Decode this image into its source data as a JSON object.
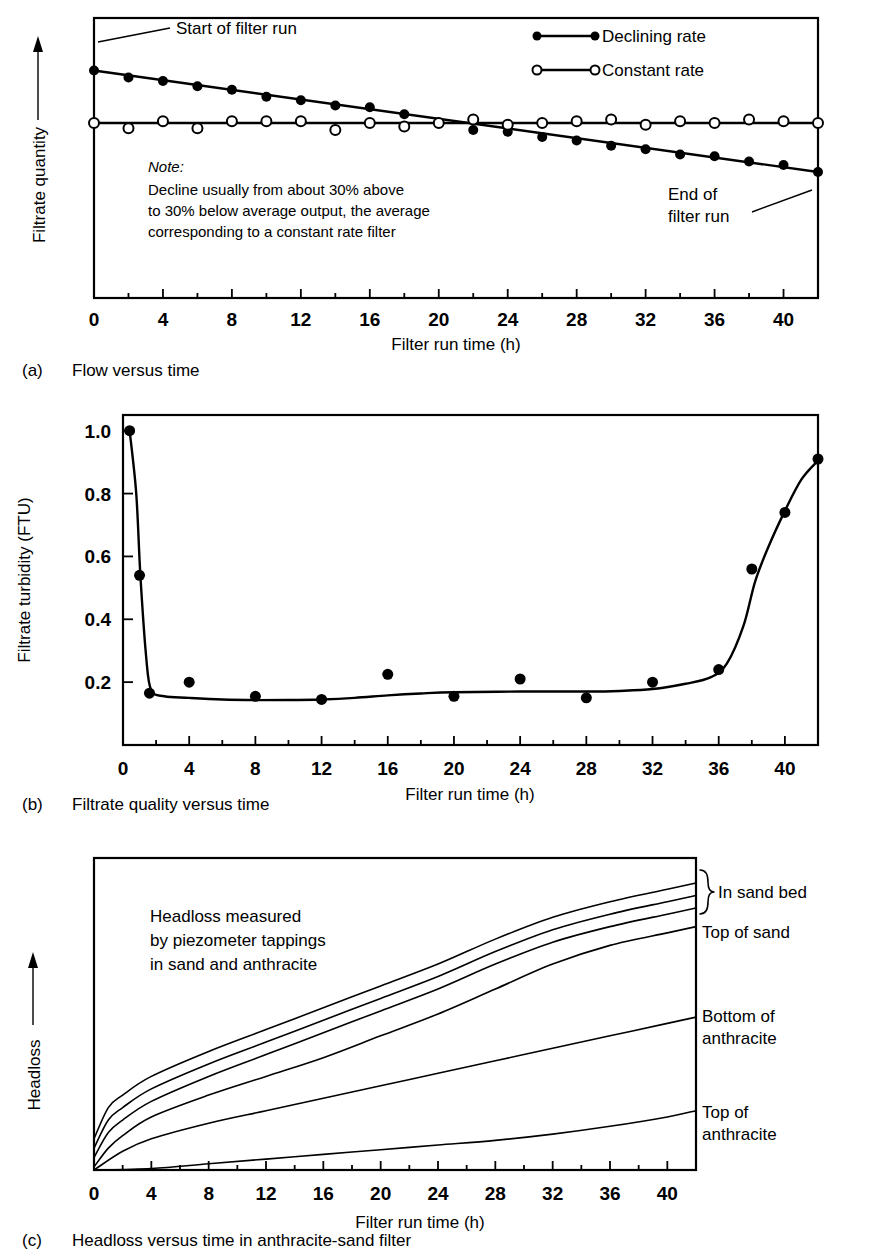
{
  "figure": {
    "panels": [
      {
        "tag": "(a)",
        "caption": "Flow versus time",
        "ylabel": "Filtrate quantity",
        "xlabel": "Filter run time (h)",
        "annotations": {
          "start": "Start of filter run",
          "end_line1": "End of",
          "end_line2": "filter run"
        },
        "legend": [
          {
            "label": "Declining rate",
            "marker": "filled-circle"
          },
          {
            "label": "Constant rate",
            "marker": "open-circle"
          }
        ],
        "note": {
          "head": "Note:",
          "lines": [
            "Decline usually from about 30% above",
            "to 30% below average output, the average",
            "corresponding to a constant rate filter"
          ]
        }
      },
      {
        "tag": "(b)",
        "caption": "Filtrate quality versus time",
        "ylabel": "Filtrate turbidity (FTU)",
        "xlabel": "Filter run time (h)"
      },
      {
        "tag": "(c)",
        "caption": "Headloss versus time in anthracite-sand filter",
        "ylabel": "Headloss",
        "xlabel": "Filter run time (h)",
        "annotation_lines": [
          "Headloss measured",
          "by piezometer tappings",
          "in sand and anthracite"
        ],
        "side_labels": [
          {
            "text": "In sand bed",
            "brace": true
          },
          {
            "text": "Top of sand",
            "brace": false
          },
          {
            "text": "Bottom of",
            "text2": "anthracite",
            "brace": false
          },
          {
            "text": "Top of",
            "text2": "anthracite",
            "brace": false
          }
        ]
      }
    ]
  },
  "chart_data": [
    {
      "id": "panel-a",
      "type": "scatter",
      "title": "Flow versus time",
      "xlabel": "Filter run time (h)",
      "ylabel": "Filtrate quantity",
      "xlim": [
        0,
        42
      ],
      "ylim": [
        0,
        1.6
      ],
      "xticks": [
        0,
        4,
        8,
        12,
        16,
        20,
        24,
        28,
        32,
        36,
        40
      ],
      "xticklabels": [
        "0",
        "4",
        "8",
        "12",
        "16",
        "20",
        "24",
        "28",
        "32",
        "36",
        "40"
      ],
      "yticks": [],
      "grid": false,
      "legend_position": "top-right",
      "series": [
        {
          "name": "Declining rate",
          "marker": "filled-circle",
          "x": [
            0,
            2,
            4,
            6,
            8,
            10,
            12,
            14,
            16,
            18,
            20,
            22,
            24,
            26,
            28,
            30,
            32,
            34,
            36,
            38,
            40,
            42
          ],
          "y": [
            1.3,
            1.26,
            1.24,
            1.21,
            1.19,
            1.15,
            1.13,
            1.1,
            1.09,
            1.05,
            1.0,
            0.96,
            0.95,
            0.92,
            0.9,
            0.87,
            0.85,
            0.82,
            0.81,
            0.78,
            0.76,
            0.72
          ]
        },
        {
          "name": "Constant rate",
          "marker": "open-circle",
          "x": [
            0,
            2,
            4,
            6,
            8,
            10,
            12,
            14,
            16,
            18,
            20,
            22,
            24,
            26,
            28,
            30,
            32,
            34,
            36,
            38,
            40,
            42
          ],
          "y": [
            1.0,
            0.97,
            1.01,
            0.97,
            1.01,
            1.01,
            1.01,
            0.96,
            1.0,
            0.98,
            1.0,
            1.02,
            0.99,
            1.0,
            1.01,
            1.02,
            0.99,
            1.01,
            1.0,
            1.02,
            1.01,
            1.0
          ]
        }
      ],
      "trendlines": [
        {
          "name": "Declining rate trend",
          "x": [
            0,
            42
          ],
          "y": [
            1.3,
            0.72
          ]
        },
        {
          "name": "Constant rate trend",
          "x": [
            0,
            42
          ],
          "y": [
            1.0,
            1.0
          ]
        }
      ]
    },
    {
      "id": "panel-b",
      "type": "line",
      "title": "Filtrate quality versus time",
      "xlabel": "Filter run time (h)",
      "ylabel": "Filtrate turbidity (FTU)",
      "xlim": [
        0,
        42
      ],
      "ylim": [
        0,
        1.05
      ],
      "xticks": [
        0,
        4,
        8,
        12,
        16,
        20,
        24,
        28,
        32,
        36,
        40
      ],
      "xticklabels": [
        "0",
        "4",
        "8",
        "12",
        "16",
        "20",
        "24",
        "28",
        "32",
        "36",
        "40"
      ],
      "yticks": [
        0.2,
        0.4,
        0.6,
        0.8,
        1.0
      ],
      "yticklabels": [
        "0.2",
        "0.4",
        "0.6",
        "0.8",
        "1.0"
      ],
      "grid": false,
      "series": [
        {
          "name": "Filtrate turbidity",
          "marker": "filled-circle",
          "x": [
            0.4,
            1.0,
            1.6,
            4,
            8,
            12,
            16,
            20,
            24,
            28,
            32,
            36,
            38,
            40,
            42
          ],
          "y": [
            1.0,
            0.54,
            0.165,
            0.2,
            0.155,
            0.145,
            0.225,
            0.155,
            0.21,
            0.15,
            0.2,
            0.24,
            0.56,
            0.74,
            0.91
          ]
        }
      ]
    },
    {
      "id": "panel-c",
      "type": "line",
      "title": "Headloss versus time in anthracite-sand filter",
      "xlabel": "Filter run time (h)",
      "ylabel": "Headloss",
      "xlim": [
        0,
        42
      ],
      "ylim": [
        0,
        1.0
      ],
      "xticks": [
        0,
        4,
        8,
        12,
        16,
        20,
        24,
        28,
        32,
        36,
        40
      ],
      "xticklabels": [
        "0",
        "4",
        "8",
        "12",
        "16",
        "20",
        "24",
        "28",
        "32",
        "36",
        "40"
      ],
      "yticks": [],
      "grid": false,
      "series": [
        {
          "name": "In sand bed (upper)",
          "x": [
            0,
            1,
            2,
            4,
            8,
            12,
            16,
            20,
            24,
            28,
            32,
            36,
            40,
            42
          ],
          "y": [
            0.1,
            0.2,
            0.24,
            0.3,
            0.38,
            0.45,
            0.52,
            0.59,
            0.66,
            0.74,
            0.81,
            0.86,
            0.9,
            0.92
          ]
        },
        {
          "name": "In sand bed (lower)",
          "x": [
            0,
            1,
            2,
            4,
            8,
            12,
            16,
            20,
            24,
            28,
            32,
            36,
            40,
            42
          ],
          "y": [
            0.07,
            0.16,
            0.2,
            0.26,
            0.34,
            0.41,
            0.48,
            0.55,
            0.62,
            0.7,
            0.77,
            0.82,
            0.86,
            0.88
          ]
        },
        {
          "name": "Top of sand",
          "x": [
            0,
            1,
            2,
            4,
            8,
            12,
            16,
            20,
            24,
            28,
            32,
            36,
            40,
            42
          ],
          "y": [
            0.04,
            0.12,
            0.16,
            0.22,
            0.3,
            0.37,
            0.44,
            0.51,
            0.58,
            0.66,
            0.73,
            0.78,
            0.82,
            0.84
          ]
        },
        {
          "name": "Bottom of anthracite",
          "x": [
            0,
            1,
            2,
            4,
            8,
            12,
            16,
            20,
            24,
            28,
            32,
            36,
            40,
            42
          ],
          "y": [
            0.01,
            0.07,
            0.11,
            0.17,
            0.24,
            0.3,
            0.36,
            0.43,
            0.5,
            0.58,
            0.66,
            0.72,
            0.76,
            0.78
          ]
        },
        {
          "name": "Mid anthracite",
          "x": [
            0,
            2,
            4,
            8,
            12,
            16,
            20,
            24,
            28,
            32,
            36,
            40,
            42
          ],
          "y": [
            0.0,
            0.06,
            0.1,
            0.15,
            0.19,
            0.23,
            0.27,
            0.31,
            0.35,
            0.39,
            0.43,
            0.47,
            0.49
          ]
        },
        {
          "name": "Top of anthracite",
          "x": [
            0,
            4,
            8,
            12,
            16,
            20,
            24,
            28,
            32,
            36,
            40,
            42
          ],
          "y": [
            0.0,
            0.005,
            0.02,
            0.035,
            0.05,
            0.065,
            0.08,
            0.095,
            0.115,
            0.14,
            0.17,
            0.19
          ]
        }
      ]
    }
  ]
}
